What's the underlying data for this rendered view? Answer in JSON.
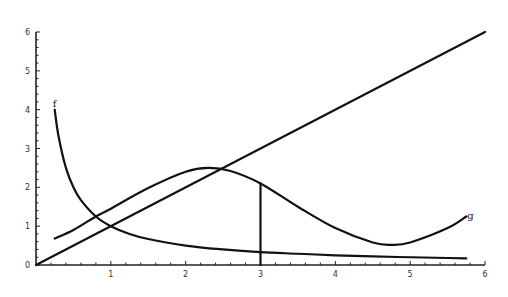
{
  "chart_data": {
    "type": "line",
    "title": "",
    "xlabel": "",
    "ylabel": "",
    "xlim": [
      0,
      6
    ],
    "ylim": [
      0,
      6
    ],
    "grid": false,
    "x_ticks": [
      "1",
      "2",
      "3",
      "4",
      "5",
      "6"
    ],
    "y_ticks": [
      "0",
      "1",
      "2",
      "3",
      "4",
      "5",
      "6"
    ],
    "series": [
      {
        "name": "f",
        "label": "f",
        "description": "decreasing hyperbola f(x) ≈ 1/x",
        "x": [
          0.25,
          0.3,
          0.4,
          0.5,
          0.6,
          0.8,
          1.0,
          1.25,
          1.5,
          2.0,
          2.5,
          3.0,
          3.5,
          4.0,
          4.5,
          5.0,
          5.5,
          5.75
        ],
        "y": [
          4.0,
          3.33,
          2.5,
          2.0,
          1.67,
          1.25,
          1.0,
          0.8,
          0.67,
          0.5,
          0.4,
          0.33,
          0.29,
          0.25,
          0.22,
          0.2,
          0.18,
          0.17
        ]
      },
      {
        "name": "g",
        "label": "g",
        "description": "curve rising to max near x=2.3 then falling to min near x=4.75",
        "x": [
          0.25,
          0.5,
          0.8,
          1.0,
          1.5,
          2.0,
          2.3,
          2.6,
          3.0,
          3.5,
          4.0,
          4.5,
          4.75,
          5.0,
          5.5,
          5.75
        ],
        "y": [
          0.68,
          0.9,
          1.25,
          1.45,
          1.98,
          2.4,
          2.5,
          2.42,
          2.1,
          1.5,
          0.95,
          0.58,
          0.52,
          0.58,
          0.95,
          1.25
        ]
      },
      {
        "name": "y=x",
        "label": "",
        "description": "straight line through origin",
        "x": [
          0,
          6
        ],
        "y": [
          0,
          6
        ]
      }
    ],
    "annotations": [
      {
        "type": "vertical-segment",
        "x": 3,
        "y_from": 0,
        "y_to": 2.1,
        "description": "vertical line from x-axis to curve g at x = 3"
      }
    ]
  }
}
